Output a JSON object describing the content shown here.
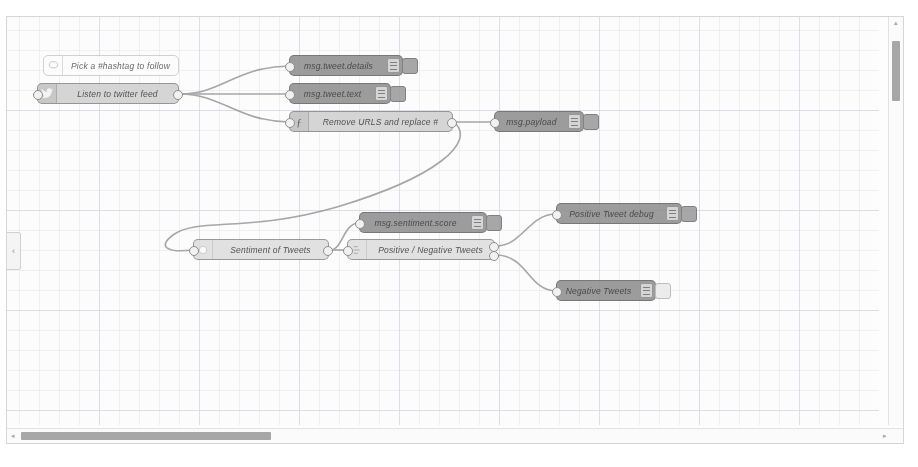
{
  "app": {
    "name": "Node-RED flow editor",
    "workspace_label": "Twitter sentiment flow"
  },
  "palette": {
    "collapse_icon": "chevron-left-icon",
    "collapse_glyph": "‹"
  },
  "scrollbars": {
    "vertical": {
      "up_glyph": "▴",
      "down_glyph": "▾"
    },
    "horizontal": {
      "left_glyph": "◂",
      "right_glyph": "▸"
    }
  },
  "nodes": [
    {
      "id": "comment-hashtag",
      "type": "comment",
      "label": "Pick a #hashtag to follow",
      "icon": "comment-icon",
      "x": 36,
      "y": 38,
      "w": 136,
      "style": "n-comment",
      "ports": {
        "in": false,
        "out": false
      }
    },
    {
      "id": "twitter-in",
      "type": "twitter",
      "label": "Listen to twitter feed",
      "icon": "twitter-bird-icon",
      "x": 30,
      "y": 66,
      "w": 142,
      "style": "n-grey",
      "ports": {
        "in": true,
        "out": true
      }
    },
    {
      "id": "debug-tweet-details",
      "type": "debug",
      "label": "msg.tweet.details",
      "icon": "debug-icon",
      "x": 282,
      "y": 38,
      "w": 114,
      "style": "n-dark",
      "ports": {
        "in": true,
        "out": false
      },
      "button_state": "on"
    },
    {
      "id": "debug-tweet-text",
      "type": "debug",
      "label": "msg.tweet.text",
      "icon": "debug-icon",
      "x": 282,
      "y": 66,
      "w": 102,
      "style": "n-dark",
      "ports": {
        "in": true,
        "out": false
      },
      "button_state": "on"
    },
    {
      "id": "function-remove-urls",
      "type": "function",
      "label": "Remove URLS and replace #",
      "icon": "function-icon",
      "x": 282,
      "y": 94,
      "w": 164,
      "style": "n-grey",
      "ports": {
        "in": true,
        "out": true
      }
    },
    {
      "id": "debug-payload",
      "type": "debug",
      "label": "msg.payload",
      "icon": "debug-icon",
      "x": 487,
      "y": 94,
      "w": 90,
      "style": "n-dark",
      "ports": {
        "in": true,
        "out": false
      },
      "button_state": "on"
    },
    {
      "id": "sentiment-of-tweets",
      "type": "sentiment",
      "label": "Sentiment of Tweets",
      "icon": "sentiment-icon",
      "x": 186,
      "y": 222,
      "w": 136,
      "style": "n-light",
      "ports": {
        "in": true,
        "out": true
      }
    },
    {
      "id": "debug-sentiment-score",
      "type": "debug",
      "label": "msg.sentiment.score",
      "icon": "debug-icon",
      "x": 352,
      "y": 195,
      "w": 128,
      "style": "n-dark",
      "ports": {
        "in": true,
        "out": false
      },
      "button_state": "on"
    },
    {
      "id": "switch-positive-negative",
      "type": "switch",
      "label": "Positive / Negative Tweets",
      "icon": "switch-icon",
      "x": 340,
      "y": 222,
      "w": 148,
      "style": "n-light",
      "ports": {
        "in": true,
        "out": true,
        "out_count": 2
      }
    },
    {
      "id": "debug-positive-tweet",
      "type": "debug",
      "label": "Positive Tweet debug",
      "icon": "debug-icon",
      "x": 549,
      "y": 186,
      "w": 126,
      "style": "n-dark",
      "ports": {
        "in": true,
        "out": false
      },
      "button_state": "on"
    },
    {
      "id": "debug-negative-tweets",
      "type": "debug",
      "label": "Negative Tweets",
      "icon": "debug-icon",
      "x": 549,
      "y": 263,
      "w": 100,
      "style": "n-dark",
      "ports": {
        "in": true,
        "out": false
      },
      "button_state": "off"
    }
  ],
  "wires": [
    {
      "from": "twitter-in",
      "to": "debug-tweet-details"
    },
    {
      "from": "twitter-in",
      "to": "debug-tweet-text"
    },
    {
      "from": "twitter-in",
      "to": "function-remove-urls"
    },
    {
      "from": "function-remove-urls",
      "to": "debug-payload"
    },
    {
      "from": "function-remove-urls",
      "to": "sentiment-of-tweets"
    },
    {
      "from": "sentiment-of-tweets",
      "to": "debug-sentiment-score"
    },
    {
      "from": "sentiment-of-tweets",
      "to": "switch-positive-negative"
    },
    {
      "from": "switch-positive-negative",
      "to": "debug-positive-tweet"
    },
    {
      "from": "switch-positive-negative",
      "to": "debug-negative-tweets"
    }
  ],
  "colors": {
    "canvas": "#fcfcfc",
    "grid": "#cdd2da",
    "wire": "#9a9a9a",
    "node_grey": "#cfcfcf",
    "node_debug": "#8e8e8e",
    "node_comment": "#fbfbfb",
    "scroll_thumb": "#a7a7a7"
  }
}
